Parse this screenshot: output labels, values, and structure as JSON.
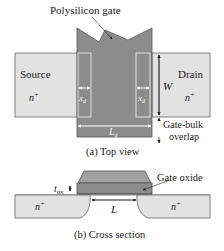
{
  "figure": {
    "top_view": {
      "gate_label": "Polysilicon gate",
      "source_label": "Source",
      "source_doping": "n",
      "source_doping_sup": "+",
      "drain_label": "Drain",
      "drain_doping": "n",
      "drain_doping_sup": "+",
      "overlap_left": "x",
      "overlap_left_sub": "d",
      "overlap_right": "x",
      "overlap_right_sub": "d",
      "width_label": "W",
      "drawn_length": "L",
      "drawn_length_sub": "d",
      "gate_bulk_line1": "Gate-bulk",
      "gate_bulk_line2": "overlap",
      "caption": "(a) Top view"
    },
    "cross_section": {
      "oxide_label": "Gate oxide",
      "tox": "t",
      "tox_sub": "ox",
      "length_label": "L",
      "left_doping": "n",
      "left_doping_sup": "+",
      "right_doping": "n",
      "right_doping_sup": "+",
      "caption": "(b) Cross section"
    },
    "colors": {
      "gate": "#8c8c8c",
      "gate_top": "#a0a0a0",
      "diffusion": "#e2e2e2",
      "outline": "#555555",
      "overlap_outline": "#f4f4f4"
    }
  }
}
